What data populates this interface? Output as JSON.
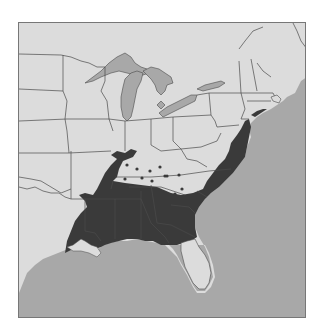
{
  "map": {
    "title": "Species range map — eastern United States",
    "region": "Eastern United States",
    "legend": [
      {
        "label": "Range (dark shading)",
        "color": "#3a3a3a"
      },
      {
        "label": "Scattered occurrences (dots)",
        "color": "#3a3a3a"
      },
      {
        "label": "Land outside range",
        "color": "#dcdcdc"
      },
      {
        "label": "Water (Great Lakes, Atlantic Ocean, Gulf of Mexico)",
        "color": "#a8a8a8"
      }
    ],
    "colors": {
      "land": "#dcdcdc",
      "range": "#3a3a3a",
      "water": "#a8a8a8",
      "border": "#4a4a4a",
      "frame": "#777777"
    },
    "range_states": [
      "Louisiana",
      "Arkansas",
      "Mississippi",
      "Alabama",
      "Georgia",
      "South Carolina",
      "North Carolina",
      "Virginia",
      "Maryland",
      "Delaware",
      "Tennessee (west)",
      "East Texas",
      "Oklahoma (southeast)",
      "Missouri (southeast)",
      "Florida (north)"
    ],
    "dot_region": "Kentucky / Tennessee",
    "dots": [
      [
        126,
        164
      ],
      [
        136,
        168
      ],
      [
        149,
        170
      ],
      [
        159,
        166
      ],
      [
        141,
        177
      ],
      [
        151,
        180
      ],
      [
        164,
        175
      ],
      [
        176,
        174
      ],
      [
        180,
        187
      ],
      [
        174,
        192
      ],
      [
        125,
        176
      ],
      [
        90,
        156
      ]
    ]
  }
}
